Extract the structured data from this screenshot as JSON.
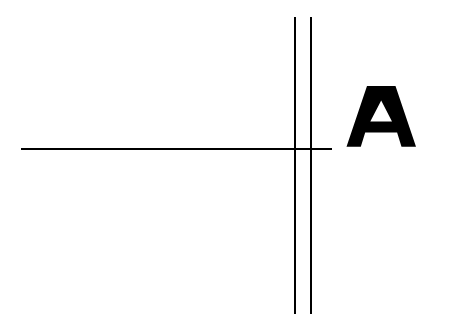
{
  "figure": {
    "background_color": "#ffffff",
    "ink_color": "#000000",
    "width": 451,
    "height": 322
  },
  "glyph": {
    "character": "A",
    "style": "bold sans-serif",
    "color": "#000000",
    "left": 347,
    "top": 86,
    "width": 69,
    "height": 61
  },
  "strokes": {
    "horizontal_line": {
      "name": "horizontal line",
      "x1": 21,
      "y1": 149,
      "x2": 332,
      "y2": 149,
      "thickness": 2,
      "color": "#000000"
    },
    "vertical_line_left": {
      "name": "left vertical line",
      "x1": 295,
      "y1": 17,
      "x2": 295,
      "y2": 314,
      "thickness": 2,
      "color": "#000000"
    },
    "vertical_line_right": {
      "name": "right vertical line",
      "x1": 311,
      "y1": 17,
      "x2": 311,
      "y2": 314,
      "thickness": 2,
      "color": "#000000"
    }
  }
}
